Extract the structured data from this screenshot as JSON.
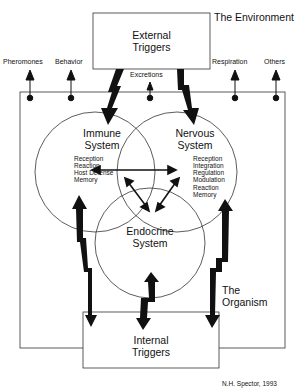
{
  "diagram": {
    "environment_label": "The Environment",
    "organism_label": "The Organism",
    "credit": "N.H. Spector, 1993",
    "external_triggers": {
      "line1": "External",
      "line2": "Triggers"
    },
    "internal_triggers": {
      "line1": "Internal",
      "line2": "Triggers"
    },
    "outputs": [
      "Pheromones",
      "Behavior",
      "Excretions",
      "Respiration",
      "Others"
    ],
    "immune": {
      "line1": "Immune",
      "line2": "System",
      "functions": [
        "Reception",
        "Reaction",
        "Host Defense",
        "Memory"
      ]
    },
    "nervous": {
      "line1": "Nervous",
      "line2": "System",
      "functions": [
        "Reception",
        "Integration",
        "Regulation",
        "Modulation",
        "Reaction",
        "Memory"
      ]
    },
    "endocrine": {
      "line1": "Endocrine",
      "line2": "System"
    },
    "colors": {
      "ink": "#111111",
      "background": "#ffffff"
    }
  }
}
